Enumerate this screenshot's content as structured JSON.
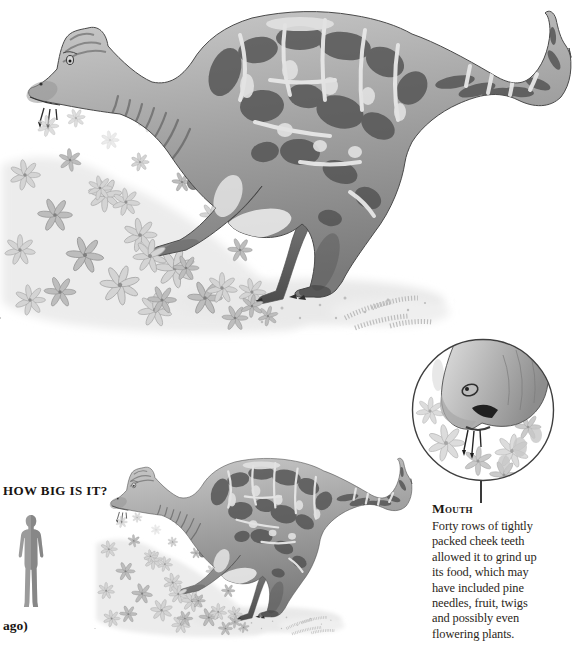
{
  "illustration": {
    "subject": "crested hadrosaur dinosaur feeding on low plants",
    "style": "grayscale pencil illustration",
    "scale_copy": "smaller version of the same dinosaur for size comparison"
  },
  "size_panel": {
    "heading": "HOW BIG IS IT?",
    "human_icon": "human-silhouette",
    "caption_fragment": "ago)"
  },
  "mouth_callout": {
    "heading": "Mouth",
    "lines": [
      "Forty rows of tightly",
      "packed cheek teeth",
      "allowed it to grind up",
      "its food, which may",
      "have included pine",
      "needles, fruit, twigs",
      "and possibly even",
      "flowering plants."
    ],
    "inset_icon": "magnified-mouth-circle"
  },
  "colors": {
    "page_bg": "#ffffff",
    "text": "#221d18",
    "silhouette_gray": "#9b9b9b",
    "circle_stroke": "#3f3f3f"
  }
}
